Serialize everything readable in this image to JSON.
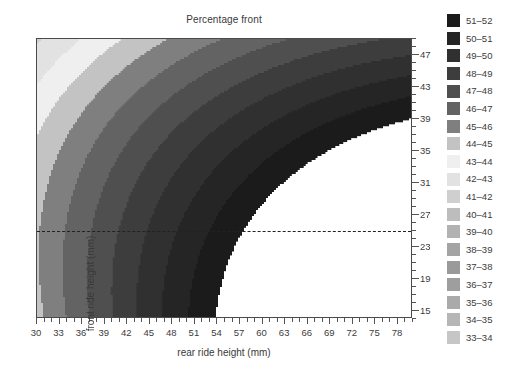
{
  "chart_data": {
    "type": "heatmap",
    "title": "Percentage front",
    "xlabel": "rear ride height (mm)",
    "ylabel": "front ride height (mm)",
    "xlim": [
      30,
      80
    ],
    "ylim": [
      14,
      49
    ],
    "xticks": [
      30,
      33,
      36,
      39,
      42,
      45,
      48,
      51,
      54,
      57,
      60,
      63,
      66,
      69,
      72,
      75,
      78
    ],
    "yticks": [
      15,
      19,
      23,
      27,
      31,
      35,
      39,
      43,
      47
    ],
    "xtick_minor_step": 1,
    "ytick_minor_step": 1,
    "grid": false,
    "annotations": [
      {
        "kind": "dashed-horizontal-line",
        "y": 25,
        "label": ""
      }
    ],
    "legend_position": "right",
    "legend_title": "",
    "bands": [
      {
        "label": "51–52",
        "min": 51,
        "max": 52,
        "color": "#1b1b1b"
      },
      {
        "label": "50–51",
        "min": 50,
        "max": 51,
        "color": "#252525"
      },
      {
        "label": "49–50",
        "min": 49,
        "max": 50,
        "color": "#303030"
      },
      {
        "label": "48–49",
        "min": 48,
        "max": 49,
        "color": "#3d3d3d"
      },
      {
        "label": "47–48",
        "min": 47,
        "max": 48,
        "color": "#4f4f4f"
      },
      {
        "label": "46–47",
        "min": 46,
        "max": 47,
        "color": "#636363"
      },
      {
        "label": "45–46",
        "min": 45,
        "max": 46,
        "color": "#7f7f7f"
      },
      {
        "label": "44–45",
        "min": 44,
        "max": 45,
        "color": "#c3c3c3"
      },
      {
        "label": "43–44",
        "min": 43,
        "max": 44,
        "color": "#efefef"
      },
      {
        "label": "42–43",
        "min": 42,
        "max": 43,
        "color": "#e2e2e2"
      },
      {
        "label": "41–42",
        "min": 41,
        "max": 42,
        "color": "#cfcfcf"
      },
      {
        "label": "40–41",
        "min": 40,
        "max": 41,
        "color": "#bdbdbd"
      },
      {
        "label": "39–40",
        "min": 39,
        "max": 40,
        "color": "#b2b2b2"
      },
      {
        "label": "38–39",
        "min": 38,
        "max": 39,
        "color": "#a4a4a4"
      },
      {
        "label": "37–38",
        "min": 37,
        "max": 38,
        "color": "#9a9a9a"
      },
      {
        "label": "36–37",
        "min": 36,
        "max": 37,
        "color": "#9e9e9e"
      },
      {
        "label": "35–36",
        "min": 35,
        "max": 36,
        "color": "#aaaaaa"
      },
      {
        "label": "34–35",
        "min": 34,
        "max": 35,
        "color": "#b6b6b6"
      },
      {
        "label": "33–34",
        "min": 33,
        "max": 34,
        "color": "#c6c6c6"
      }
    ],
    "surface_model": {
      "description": "percentage front as smooth function of rear (x) and front (y) ride height; values outside 33-52 are blank/white",
      "center_rear": 52.0,
      "center_front": 44.0,
      "peak_value": 47.1,
      "curvature_x": 0.00165,
      "curvature_y": 0.0042,
      "cross_term": 0.0039,
      "tilt_x": 0.156,
      "tilt_y": -0.272,
      "blank_color": "#ffffff"
    }
  },
  "axes": {
    "frame_color": "#4a4a4a",
    "tick_color": "#555555",
    "text_color": "#3c3c3c"
  }
}
